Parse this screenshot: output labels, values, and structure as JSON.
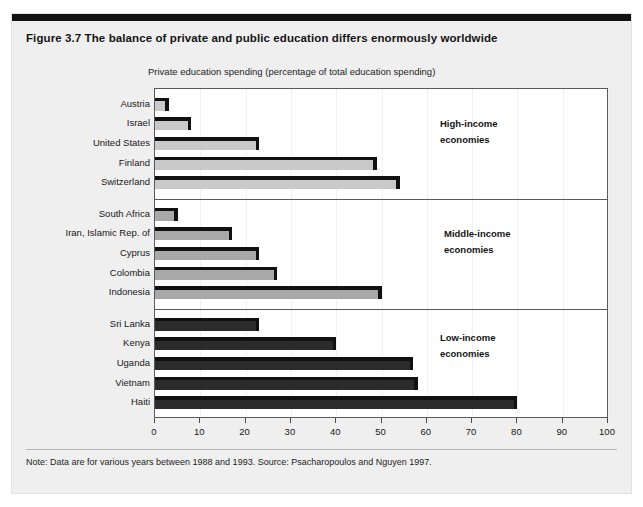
{
  "figure": {
    "title": "Figure 3.7  The balance of private and public education differs enormously worldwide",
    "axis_caption": "Private education spending (percentage of total education spending)",
    "footnote": "Note: Data are for various years between 1988 and 1993. Source: Psacharopoulos and Nguyen 1997."
  },
  "colors": {
    "high_income_bar": "#c9c9c9",
    "middle_income_bar": "#a8a8a8",
    "low_income_bar": "#2b2b2b",
    "bar_edge": "#111111",
    "panel_background": "#efefef",
    "plot_background": "#ffffff",
    "frame": "#5a5a5a",
    "top_rule": "#111111"
  },
  "chart_data": {
    "type": "bar",
    "orientation": "horizontal",
    "title": "Figure 3.7  The balance of private and public education differs enormously worldwide",
    "xlabel": "Private education spending (percentage of total education spending)",
    "ylabel": "",
    "xlim": [
      0,
      100
    ],
    "xticks": [
      0,
      10,
      20,
      30,
      40,
      50,
      60,
      70,
      80,
      90,
      100
    ],
    "grid": false,
    "legend_position": "inline-annotations",
    "categories": [
      "Austria",
      "Israel",
      "United States",
      "Finland",
      "Switzerland",
      "South Africa",
      "Iran, Islamic Rep. of",
      "Cyprus",
      "Colombia",
      "Indonesia",
      "Sri Lanka",
      "Kenya",
      "Uganda",
      "Vietnam",
      "Haiti"
    ],
    "values": [
      3,
      8,
      23,
      49,
      54,
      5,
      17,
      23,
      27,
      50,
      23,
      40,
      57,
      58,
      80
    ],
    "groups": [
      {
        "name": "high-income",
        "annotation": [
          "High-income",
          "economies"
        ],
        "bar_color": "#c9c9c9",
        "items": [
          {
            "label": "Austria",
            "value": 3
          },
          {
            "label": "Israel",
            "value": 8
          },
          {
            "label": "United States",
            "value": 23
          },
          {
            "label": "Finland",
            "value": 49
          },
          {
            "label": "Switzerland",
            "value": 54
          }
        ]
      },
      {
        "name": "middle-income",
        "annotation": [
          "Middle-income",
          "economies"
        ],
        "bar_color": "#a8a8a8",
        "items": [
          {
            "label": "South Africa",
            "value": 5
          },
          {
            "label": "Iran, Islamic Rep. of",
            "value": 17
          },
          {
            "label": "Cyprus",
            "value": 23
          },
          {
            "label": "Colombia",
            "value": 27
          },
          {
            "label": "Indonesia",
            "value": 50
          }
        ]
      },
      {
        "name": "low-income",
        "annotation": [
          "Low-income",
          "economies"
        ],
        "bar_color": "#2b2b2b",
        "items": [
          {
            "label": "Sri Lanka",
            "value": 23
          },
          {
            "label": "Kenya",
            "value": 40
          },
          {
            "label": "Uganda",
            "value": 57
          },
          {
            "label": "Vietnam",
            "value": 58
          },
          {
            "label": "Haiti",
            "value": 80
          }
        ]
      }
    ]
  }
}
